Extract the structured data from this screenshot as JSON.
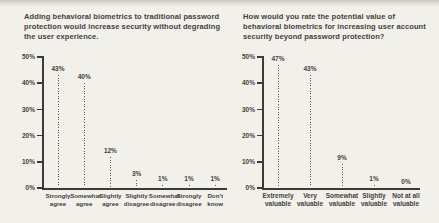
{
  "figure": {
    "background": "#f2f0ea",
    "ink": "#44413c"
  },
  "chart_data": [
    {
      "type": "bar",
      "style": "dotted vertical line (lollipop without head)",
      "title": "Adding behavioral biometrics to traditional password protection would increase security without degrading the user experience.",
      "categories": [
        "Strongly agree",
        "Somewhat agree",
        "Slightly agree",
        "Slightly disagree",
        "Somewhat disagree",
        "Strongly disagree",
        "Don't know"
      ],
      "values": [
        43,
        40,
        12,
        3,
        1,
        1,
        1
      ],
      "value_labels": [
        "43%",
        "40%",
        "12%",
        "3%",
        "1%",
        "1%",
        "1%"
      ],
      "xlabel": "",
      "ylabel": "",
      "ylim": [
        0,
        50
      ],
      "yticks": [
        0,
        10,
        20,
        30,
        40,
        50
      ],
      "ytick_labels": [
        "0%",
        "10%",
        "20%",
        "30%",
        "40%",
        "50%"
      ],
      "grid": false,
      "legend": false
    },
    {
      "type": "bar",
      "style": "dotted vertical line (lollipop without head)",
      "title": "How would you rate the potential value of behavioral biometrics for increasing user account security beyond password protection?",
      "categories": [
        "Extremely valuable",
        "Very valuable",
        "Somewhat valuable",
        "Slightly valuable",
        "Not at all valuable"
      ],
      "values": [
        47,
        43,
        9,
        1,
        0
      ],
      "value_labels": [
        "47%",
        "43%",
        "9%",
        "1%",
        "0%"
      ],
      "xlabel": "",
      "ylabel": "",
      "ylim": [
        0,
        50
      ],
      "yticks": [
        0,
        10,
        20,
        30,
        40,
        50
      ],
      "ytick_labels": [
        "0%",
        "10%",
        "20%",
        "30%",
        "40%",
        "50%"
      ],
      "grid": false,
      "legend": false
    }
  ]
}
